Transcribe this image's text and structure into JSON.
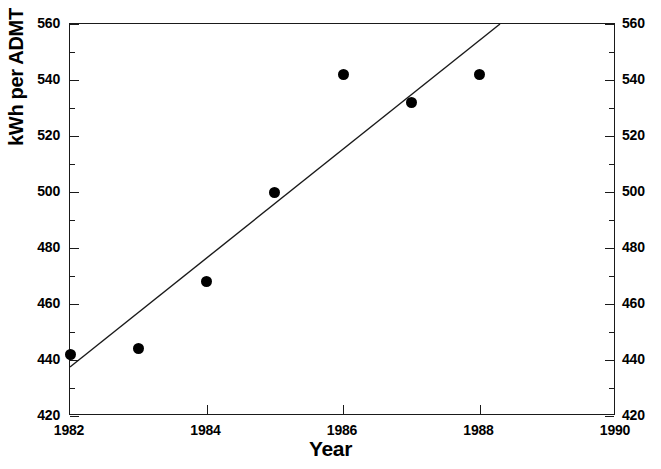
{
  "chart_data": {
    "type": "scatter",
    "title": "",
    "xlabel": "Year",
    "ylabel": "kWh per ADMT",
    "xlim": [
      1982,
      1990
    ],
    "ylim": [
      420,
      560
    ],
    "x_ticks": [
      1982,
      1984,
      1986,
      1988,
      1990
    ],
    "x_tick_labels": [
      "1982",
      "1984",
      "1986",
      "1988",
      "1990"
    ],
    "x_minor_ticks": [],
    "y_ticks": [
      420,
      440,
      460,
      480,
      500,
      520,
      540,
      560
    ],
    "y_tick_labels": [
      "420",
      "440",
      "460",
      "480",
      "500",
      "520",
      "540",
      "560"
    ],
    "y_minor_ticks": [
      430,
      450,
      470,
      490,
      510,
      530,
      550
    ],
    "y_axis_right_labels": [
      "420",
      "440",
      "460",
      "480",
      "500",
      "520",
      "540",
      "560"
    ],
    "grid": false,
    "legend": null,
    "tick_direction": "in",
    "marker": "filled-circle",
    "marker_color": "#000000",
    "line_color": "#000000",
    "x": [
      1982,
      1983,
      1984,
      1985,
      1986,
      1987,
      1988
    ],
    "values": [
      442,
      444,
      468,
      500,
      542,
      532,
      542
    ],
    "series": [
      {
        "name": "kWh per ADMT",
        "x": [
          1982,
          1983,
          1984,
          1985,
          1986,
          1987,
          1988
        ],
        "values": [
          442,
          444,
          468,
          500,
          542,
          532,
          542
        ]
      },
      {
        "name": "trend-line",
        "type": "line",
        "x": [
          1982,
          1988.3
        ],
        "values": [
          437.5,
          560
        ]
      }
    ],
    "annotations": []
  },
  "axes": {
    "y_title": "kWh per ADMT",
    "x_title": "Year"
  }
}
